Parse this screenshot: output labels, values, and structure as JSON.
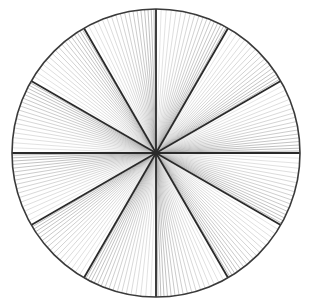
{
  "diagram": {
    "shape": "circle",
    "center": [
      156,
      153
    ],
    "radius": 144,
    "sectors": 12,
    "sector_angle_deg": 30,
    "start_angle_deg": 0,
    "fine_lines_per_sector": 18,
    "colors": {
      "background": "#ffffff",
      "outline": "#3a3a3a",
      "spoke": "#2a2a2a",
      "fine_line_dark": "#8a8a8a",
      "fine_line_light": "#d8d8d8"
    },
    "stroke_widths": {
      "outline": 1.6,
      "spoke": 1.8,
      "fine_line": 0.6
    }
  }
}
